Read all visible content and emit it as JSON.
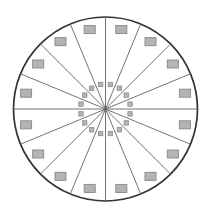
{
  "figure": {
    "background_color": "#ffffff",
    "canvas": {
      "width": 211,
      "height": 219
    },
    "circle": {
      "cx": 105.5,
      "cy": 109,
      "r": 92,
      "stroke_color": "#333333",
      "stroke_width": 1.7,
      "fill_color": "#ffffff"
    },
    "sectors": {
      "count": 16,
      "angle_step_deg": 22.5,
      "boundary_start_deg": 0,
      "line_color": "#636363",
      "line_width": 0.9
    },
    "outer_markers": {
      "count": 16,
      "ring_radius": 81,
      "marker_width": 11,
      "marker_height": 8,
      "fill_color": "#b4b4b4",
      "stroke_color": "#8e8e8e",
      "stroke_width": 1,
      "first_angle_deg": 11.25,
      "angle_step_deg": 22.5
    },
    "inner_markers": {
      "count": 16,
      "ring_radius": 25,
      "marker_width": 4.4,
      "marker_height": 4.4,
      "fill_color": "#b4b4b4",
      "stroke_color": "#8e8e8e",
      "stroke_width": 0.8,
      "first_angle_deg": 11.25,
      "angle_step_deg": 22.5
    }
  }
}
